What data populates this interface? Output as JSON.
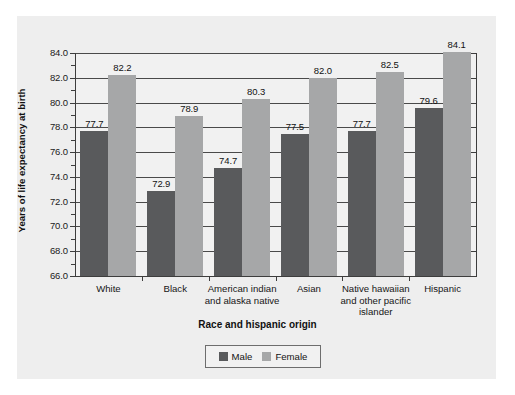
{
  "chart_data": {
    "type": "bar",
    "title": "",
    "xlabel": "Race and hispanic origin",
    "ylabel": "Years of life expectancy at birth",
    "categories": [
      "White",
      "Black",
      "American indian\nand alaska native",
      "Asian",
      "Native hawaiian\nand other pacific\nislander",
      "Hispanic"
    ],
    "series": [
      {
        "name": "Male",
        "color": "#595a5c",
        "values": [
          77.7,
          72.9,
          74.7,
          77.5,
          77.7,
          79.6
        ],
        "labels": [
          "77.7",
          "72.9",
          "74.7",
          "77.5",
          "77.7",
          "79.6"
        ]
      },
      {
        "name": "Female",
        "color": "#a6a7a8",
        "values": [
          82.2,
          78.9,
          80.3,
          82.0,
          82.5,
          84.1
        ],
        "labels": [
          "82.2",
          "78.9",
          "80.3",
          "82.0",
          "82.5",
          "84.1"
        ]
      }
    ],
    "ylim": [
      66.0,
      84.0
    ],
    "ytick_step": 2.0,
    "ytick_labels": [
      "84.0",
      "82.0",
      "80.0",
      "78.0",
      "76.0",
      "74.0",
      "72.0",
      "70.0",
      "68.0",
      "66.0"
    ],
    "ytick_values": [
      84.0,
      82.0,
      80.0,
      78.0,
      76.0,
      74.0,
      72.0,
      70.0,
      68.0,
      66.0
    ],
    "grid": true,
    "legend_position": "bottom",
    "legend_entries": [
      "Male",
      "Female"
    ]
  },
  "legend": {
    "male_label": "Male",
    "female_label": "Female"
  }
}
